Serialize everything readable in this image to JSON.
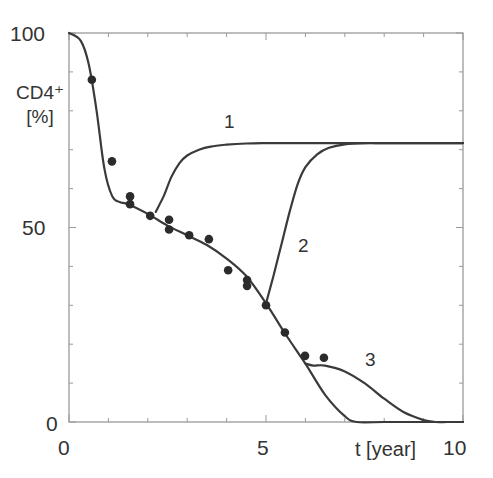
{
  "chart_data": {
    "type": "line",
    "title": "",
    "xlabel": "t [year]",
    "ylabel": "CD4+ [%]",
    "ylabel_lines": [
      "CD4⁺",
      "[%]"
    ],
    "xlim": [
      0,
      10
    ],
    "ylim": [
      0,
      100
    ],
    "x_ticks": [
      0,
      5,
      10
    ],
    "y_ticks": [
      0,
      50,
      100
    ],
    "x_tick_labels": [
      "0",
      "5",
      "10"
    ],
    "y_tick_labels": [
      "0",
      "50",
      "100"
    ],
    "grid": false,
    "legend": null,
    "series": [
      {
        "name": "baseline (no therapy)",
        "kind": "line",
        "x": [
          0,
          0.3,
          0.5,
          0.7,
          0.9,
          1.1,
          1.3,
          1.5,
          2.0,
          2.5,
          3.0,
          3.5,
          4.0,
          4.5,
          5.0,
          5.5,
          6.0,
          6.5,
          7.0,
          7.3,
          8.0,
          9.0,
          10.0
        ],
        "values": [
          100,
          98,
          92,
          80,
          65,
          58,
          56.5,
          56,
          53.5,
          50.5,
          48,
          45.5,
          42,
          37.5,
          30.5,
          22.5,
          15,
          7,
          1.5,
          0,
          0,
          0,
          0
        ]
      },
      {
        "name": "1",
        "kind": "line",
        "label": "1",
        "x": [
          2.2,
          2.4,
          2.6,
          2.8,
          3.0,
          3.3,
          3.6,
          4.0,
          4.5,
          5.0,
          6.0,
          7.0,
          8.0,
          9.0,
          10.0
        ],
        "values": [
          54,
          58,
          63,
          66.5,
          68.5,
          70,
          70.8,
          71.3,
          71.6,
          71.7,
          71.7,
          71.7,
          71.7,
          71.7,
          71.7
        ]
      },
      {
        "name": "2",
        "kind": "line",
        "label": "2",
        "x": [
          5.0,
          5.2,
          5.4,
          5.6,
          5.8,
          6.0,
          6.3,
          6.6,
          7.0,
          7.5,
          8.0,
          9.0,
          10.0
        ],
        "values": [
          30.5,
          38,
          46,
          54,
          61,
          65.5,
          68.8,
          70.5,
          71.4,
          71.7,
          71.7,
          71.7,
          71.7
        ]
      },
      {
        "name": "3",
        "kind": "line",
        "label": "3",
        "x": [
          6.0,
          6.2,
          6.5,
          7.0,
          7.5,
          8.0,
          8.5,
          9.0,
          9.3,
          9.6,
          10.0
        ],
        "values": [
          15,
          14.5,
          14.5,
          13,
          10,
          6,
          2.5,
          0.5,
          0,
          0,
          0
        ]
      },
      {
        "name": "measured data",
        "kind": "scatter",
        "x": [
          0.58,
          1.09,
          1.55,
          1.55,
          2.06,
          2.54,
          2.54,
          3.05,
          3.55,
          4.04,
          4.52,
          4.52,
          5.0,
          5.48,
          5.99,
          6.47
        ],
        "values": [
          88,
          67,
          58,
          56,
          53,
          52,
          49.5,
          48,
          47,
          39,
          36.5,
          35,
          30,
          23,
          17,
          16.5
        ]
      }
    ],
    "annotations": [
      {
        "text": "1",
        "x": 3.9,
        "y": 77
      },
      {
        "text": "2",
        "x": 5.8,
        "y": 45
      },
      {
        "text": "3",
        "x": 7.6,
        "y": 16
      }
    ]
  },
  "colors": {
    "line": "#3a3a3a",
    "axis": "#9a9a9a",
    "marker": "#2b2b2b",
    "text": "#333333"
  }
}
